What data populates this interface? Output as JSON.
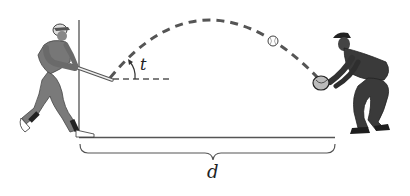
{
  "diagram": {
    "type": "projectile-motion-illustration",
    "labels": {
      "angle": "t",
      "distance": "d"
    },
    "figures": {
      "left": "batter",
      "right": "fielder",
      "projectile": "baseball"
    },
    "colors": {
      "line": "#3a3a3a",
      "figure": "#6e6e6e",
      "figure_dark": "#2a2a2a",
      "background": "#ffffff"
    }
  }
}
